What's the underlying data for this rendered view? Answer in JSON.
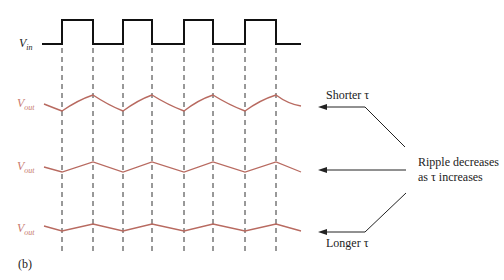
{
  "figure": {
    "panel_label": "(b)",
    "input": {
      "label": "V",
      "sub": "in",
      "color": "#222222"
    },
    "outputs": [
      {
        "label": "V",
        "sub": "out",
        "color": "#c87a6f",
        "ripple": "large"
      },
      {
        "label": "V",
        "sub": "out",
        "color": "#c87a6f",
        "ripple": "medium"
      },
      {
        "label": "V",
        "sub": "out",
        "color": "#c87a6f",
        "ripple": "small"
      }
    ],
    "annotations": {
      "shorter": "Shorter τ",
      "ripple_line1": "Ripple decreases",
      "ripple_line2": "as τ increases",
      "longer": "Longer τ"
    }
  }
}
